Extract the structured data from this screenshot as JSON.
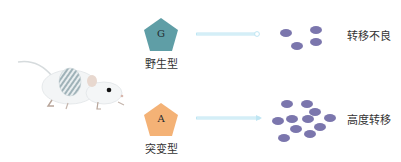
{
  "figure": {
    "rows": [
      {
        "genotype_letter": "G",
        "genotype_label": "野生型",
        "shape": "pentagon",
        "color": "#5f9ea6",
        "outcome_label": "转移不良",
        "dot_count": 4
      },
      {
        "genotype_letter": "A",
        "genotype_label": "突变型",
        "shape": "pentagon",
        "color": "#f4b276",
        "outcome_label": "高度转移",
        "dot_count": 11
      }
    ],
    "arrow_color": "#bfe6f3",
    "dot_color": "#7b76ad"
  }
}
